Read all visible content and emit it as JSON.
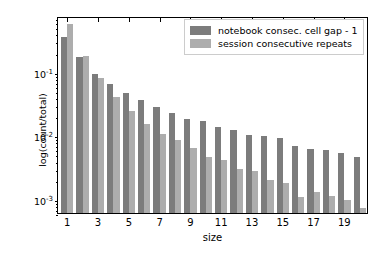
{
  "chart_data": {
    "type": "bar",
    "title": "",
    "xlabel": "size",
    "ylabel": "log(count/total)",
    "yscale": "log",
    "ylim": [
      0.0006,
      0.75
    ],
    "xlim": [
      0.4,
      20.6
    ],
    "grid": false,
    "legend_position": "upper right",
    "categories": [
      1,
      2,
      3,
      4,
      5,
      6,
      7,
      8,
      9,
      10,
      11,
      12,
      13,
      14,
      15,
      16,
      17,
      18,
      19,
      20
    ],
    "xtick_labels": [
      "1",
      "3",
      "5",
      "7",
      "9",
      "11",
      "13",
      "15",
      "17",
      "19"
    ],
    "xtick_values": [
      1,
      3,
      5,
      7,
      9,
      11,
      13,
      15,
      17,
      19
    ],
    "ytick_labels": [
      "10⁻¹",
      "10⁻²",
      "10⁻³"
    ],
    "ytick_values": [
      0.1,
      0.01,
      0.001
    ],
    "series": [
      {
        "name": "notebook consec. cell gap - 1",
        "color": "#7c7c7c",
        "values": [
          0.345,
          0.168,
          0.091,
          0.064,
          0.0455,
          0.0355,
          0.0275,
          0.0222,
          0.0183,
          0.0167,
          0.0137,
          0.0119,
          0.0101,
          0.0096,
          0.009,
          0.0069,
          0.006,
          0.0059,
          0.0052,
          0.0046
        ]
      },
      {
        "name": "session consecutive repeats",
        "color": "#adadad",
        "values": [
          0.56,
          0.176,
          0.079,
          0.0405,
          0.024,
          0.0148,
          0.0105,
          0.0084,
          0.0063,
          0.0046,
          0.0041,
          0.0029,
          0.0027,
          0.002,
          0.0018,
          0.00107,
          0.0013,
          0.0011,
          0.00095,
          0.00072
        ]
      }
    ]
  },
  "legend": {
    "items": [
      {
        "label": "notebook consec. cell gap - 1"
      },
      {
        "label": "session consecutive repeats"
      }
    ]
  },
  "axes": {
    "x_label": "size",
    "y_label": "log(count/total)"
  }
}
